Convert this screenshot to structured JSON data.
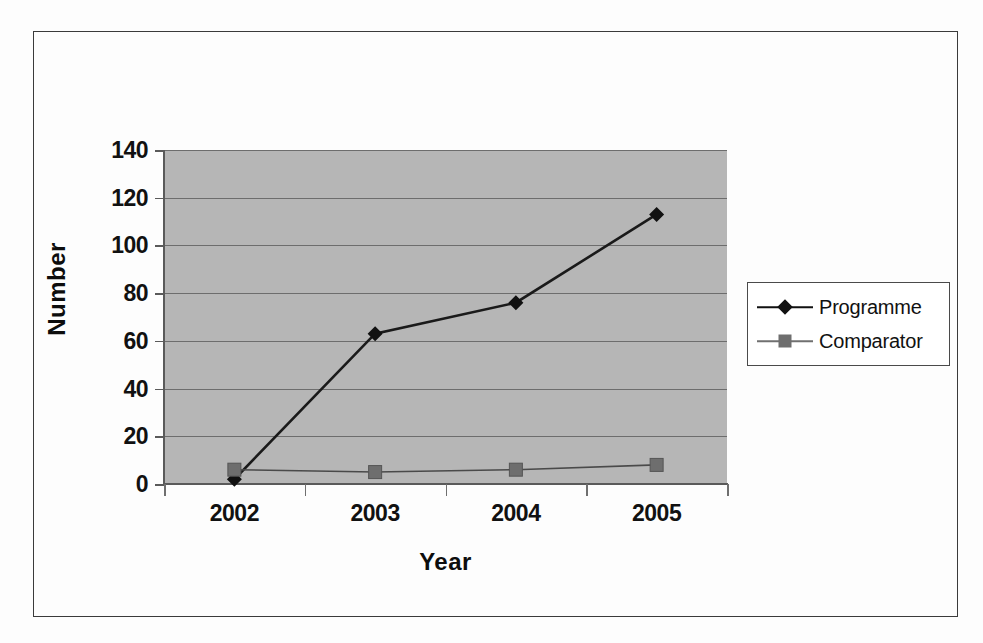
{
  "chart_data": {
    "type": "line",
    "title": "",
    "xlabel": "Year",
    "ylabel": "Number",
    "categories": [
      "2002",
      "2003",
      "2004",
      "2005"
    ],
    "series": [
      {
        "name": "Programme",
        "marker": "diamond",
        "color": "#111111",
        "values": [
          2,
          63,
          76,
          113
        ]
      },
      {
        "name": "Comparator",
        "marker": "square",
        "color": "#6e6e6e",
        "values": [
          6,
          5,
          6,
          8
        ]
      }
    ],
    "ylim": [
      0,
      140
    ],
    "ytick_step": 20,
    "yticks": [
      "140",
      "120",
      "100",
      "80",
      "60",
      "40",
      "20",
      "0"
    ],
    "grid": true,
    "legend_position": "right",
    "plot_background": "#b6b6b6",
    "gridline_color": "#6d6d6d",
    "figure_background": "#ffffff",
    "frame_color": "#3b3b3b"
  },
  "legend": {
    "entries": [
      {
        "label": "Programme"
      },
      {
        "label": "Comparator"
      }
    ]
  }
}
